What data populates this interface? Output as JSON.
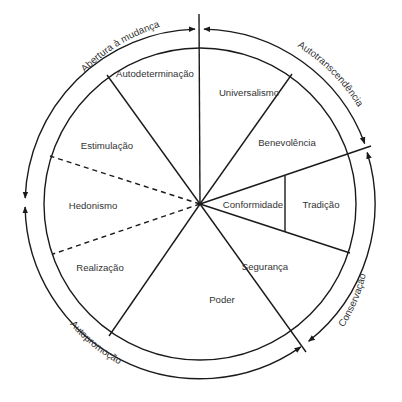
{
  "diagram": {
    "center": [
      200,
      204
    ],
    "inner_radius": 156,
    "outer_radius": 175,
    "values": [
      {
        "id": "universalismo",
        "label": "Universalismo",
        "x": 249,
        "y": 96
      },
      {
        "id": "benevolencia",
        "label": "Benevolência",
        "x": 287,
        "y": 146
      },
      {
        "id": "conformidade",
        "label": "Conformidade",
        "x": 254,
        "y": 208
      },
      {
        "id": "tradicao",
        "label": "Tradição",
        "x": 321,
        "y": 208
      },
      {
        "id": "seguranca",
        "label": "Segurança",
        "x": 322,
        "y": 268
      },
      {
        "id": "poder",
        "label": "Poder",
        "x": 222,
        "y": 301
      },
      {
        "id": "realizacao",
        "label": "Realização",
        "x": 100,
        "y": 271
      },
      {
        "id": "hedonismo",
        "label": "Hedonismo",
        "x": 91,
        "y": 209
      },
      {
        "id": "estimulacao",
        "label": "Estimulação",
        "x": 107,
        "y": 147
      },
      {
        "id": "autodeterminacao",
        "label": "Autodeterminação",
        "x": 155,
        "y": 77
      }
    ],
    "higher_order": [
      {
        "id": "abertura",
        "label": "Abertura à mudança"
      },
      {
        "id": "autotranscendencia",
        "label": "Autotranscendência"
      },
      {
        "id": "conservacao",
        "label": "Conservação"
      },
      {
        "id": "autopromocao",
        "label": "Autopromoção"
      }
    ],
    "line_style": {
      "color": "#1a1a1a",
      "text_color": "#333333"
    }
  }
}
